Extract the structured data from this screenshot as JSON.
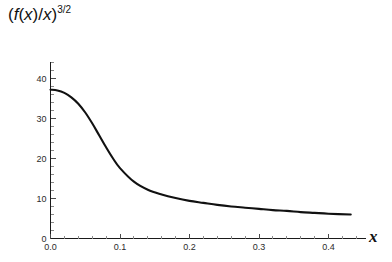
{
  "chart_data": {
    "type": "line",
    "title_parts": {
      "open_paren": "(",
      "f_var": "f",
      "arg_open": "(",
      "arg_var": "x",
      "arg_close": ")",
      "slash": "/",
      "denom_var": "x",
      "close_paren": ")",
      "exponent": "3/2"
    },
    "xlabel": "x",
    "ylabel": "",
    "xlim": [
      0.0,
      0.44
    ],
    "ylim": [
      0,
      44
    ],
    "xticks": [
      0.0,
      0.1,
      0.2,
      0.3,
      0.4
    ],
    "xticklabels": [
      "0.0",
      "0.1",
      "0.2",
      "0.3",
      "0.4"
    ],
    "yticks": [
      0,
      10,
      20,
      30,
      40
    ],
    "yticklabels": [
      "0",
      "10",
      "20",
      "30",
      "40"
    ],
    "x_minor_count": 4,
    "y_minor_count": 4,
    "grid": false,
    "legend": null,
    "line_color": "#111111",
    "axis_color": "#1a1a1a",
    "tick_color": "#4a4a4a",
    "background": "#ffffff",
    "x": [
      0.0,
      0.01,
      0.02,
      0.03,
      0.04,
      0.05,
      0.06,
      0.07,
      0.08,
      0.09,
      0.1,
      0.12,
      0.14,
      0.16,
      0.18,
      0.2,
      0.22,
      0.24,
      0.26,
      0.28,
      0.3,
      0.32,
      0.34,
      0.36,
      0.38,
      0.4,
      0.432
    ],
    "values": [
      37.2,
      37.0,
      36.4,
      35.3,
      33.7,
      31.5,
      28.8,
      25.8,
      22.8,
      20.0,
      17.6,
      14.2,
      12.2,
      11.0,
      10.1,
      9.4,
      8.9,
      8.4,
      8.0,
      7.7,
      7.4,
      7.1,
      6.9,
      6.6,
      6.4,
      6.2,
      6.0
    ],
    "series": [
      {
        "name": "(f(x)/x)^(3/2)",
        "values": [
          37.2,
          37.0,
          36.4,
          35.3,
          33.7,
          31.5,
          28.8,
          25.8,
          22.8,
          20.0,
          17.6,
          14.2,
          12.2,
          11.0,
          10.1,
          9.4,
          8.9,
          8.4,
          8.0,
          7.7,
          7.4,
          7.1,
          6.9,
          6.6,
          6.4,
          6.2,
          6.0
        ]
      }
    ]
  }
}
